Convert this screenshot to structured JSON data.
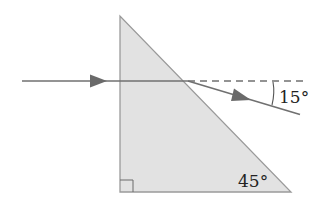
{
  "diagram": {
    "type": "optics-prism-refraction",
    "prism": {
      "shape": "right triangle",
      "fill": "#e2e2e2",
      "stroke": "#9a9a9a",
      "angle_labels": {
        "bottom_right": "45°",
        "bottom_left": "right angle"
      }
    },
    "incident_ray": {
      "direction": "horizontal, left to right",
      "color": "#707070"
    },
    "refracted_ray": {
      "deviation_label": "15°",
      "direction": "downward to the right",
      "color": "#707070"
    },
    "normal_reference": {
      "style": "dashed horizontal extension",
      "color": "#707070"
    },
    "labels": {
      "deviation_angle": "15°",
      "prism_angle": "45°"
    }
  }
}
